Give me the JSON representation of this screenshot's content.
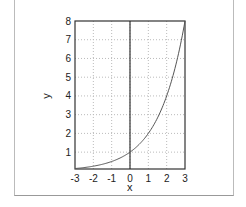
{
  "chart_data": {
    "type": "line",
    "title": "",
    "xlabel": "x",
    "ylabel": "y",
    "xlim": [
      -3,
      3
    ],
    "ylim": [
      0.1,
      8
    ],
    "grid": true,
    "legend": null,
    "x_ticks": [
      "-3",
      "-2",
      "-1",
      "0",
      "1",
      "2",
      "3"
    ],
    "y_ticks": [
      "1",
      "2",
      "3",
      "4",
      "5",
      "6",
      "7",
      "8"
    ],
    "series": [
      {
        "name": "y = 2^x",
        "x": [
          -3,
          -2.5,
          -2,
          -1.5,
          -1,
          -0.5,
          0,
          0.5,
          1,
          1.5,
          2,
          2.5,
          3
        ],
        "values": [
          0.125,
          0.177,
          0.25,
          0.354,
          0.5,
          0.707,
          1,
          1.414,
          2,
          2.828,
          4,
          5.657,
          8
        ]
      }
    ],
    "annotations": [
      "vertical line at x=0"
    ]
  }
}
